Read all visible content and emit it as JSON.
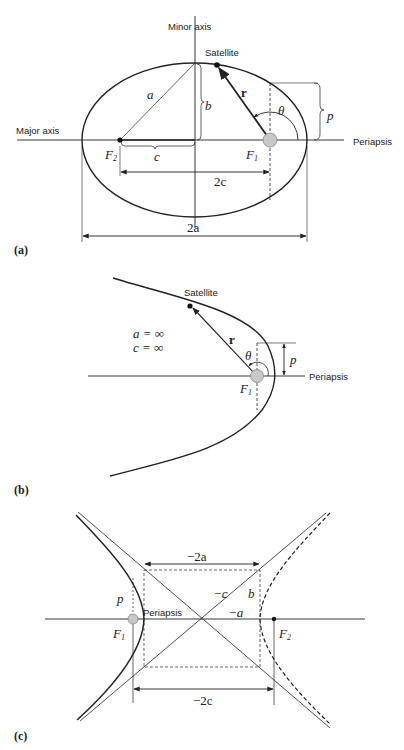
{
  "figure": {
    "panels": [
      {
        "id": "a",
        "label": "(a)",
        "type": "ellipse",
        "labels": {
          "minor_axis": "Minor axis",
          "major_axis": "Major axis",
          "satellite": "Satellite",
          "periapsis": "Periapsis",
          "r": "r",
          "theta": "θ",
          "a": "a",
          "b": "b",
          "c": "c",
          "p": "p",
          "f1": "F",
          "f1_sub": "1",
          "f2": "F",
          "f2_sub": "2",
          "two_c": "2c",
          "two_a": "2a"
        }
      },
      {
        "id": "b",
        "label": "(b)",
        "type": "parabola",
        "labels": {
          "satellite": "Satellite",
          "periapsis": "Periapsis",
          "r": "r",
          "theta": "θ",
          "p": "p",
          "f1": "F",
          "f1_sub": "1",
          "a_inf": "a = ∞",
          "c_inf": "c = ∞"
        }
      },
      {
        "id": "c",
        "label": "(c)",
        "type": "hyperbola",
        "labels": {
          "periapsis": "Periapsis",
          "p": "p",
          "b": "b",
          "neg_a": "−a",
          "neg_c": "−c",
          "neg_two_a": "−2a",
          "neg_two_c": "−2c",
          "f1": "F",
          "f1_sub": "1",
          "f2": "F",
          "f2_sub": "2"
        }
      }
    ],
    "colors": {
      "stroke": "#222222",
      "focus_fill": "#c8c8c8",
      "focus_stroke": "#888888",
      "background": "#ffffff"
    }
  }
}
